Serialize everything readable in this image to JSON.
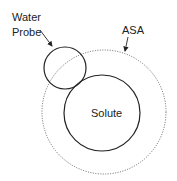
{
  "diagram": {
    "labels": {
      "water_line1": "Water",
      "water_line2": "Probe",
      "asa": "ASA",
      "solute": "Solute"
    },
    "colors": {
      "stroke": "#222222",
      "dotted": "#555555",
      "background": "#ffffff"
    }
  }
}
